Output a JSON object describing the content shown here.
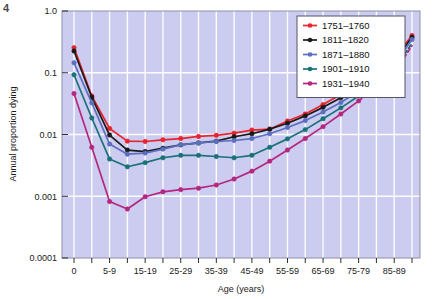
{
  "figure": {
    "number_marker": "4"
  },
  "chart_data": {
    "type": "line",
    "title": "",
    "xlabel": "Age (years)",
    "ylabel": "Annual proportion dying",
    "yscale": "log",
    "ylim": [
      0.0001,
      1.0
    ],
    "ytick_labels": [
      "1.0",
      "0.1",
      "0.01",
      "0.001",
      "0.0001"
    ],
    "ytick_values": [
      1.0,
      0.1,
      0.01,
      0.001,
      0.0001
    ],
    "grid": true,
    "grid_color": "#ffffff",
    "plot_background": "#ccccf0",
    "legend_position": "top-right",
    "categories": [
      "0",
      "1-4",
      "5-9",
      "10-14",
      "15-19",
      "20-24",
      "25-29",
      "30-34",
      "35-39",
      "40-44",
      "45-49",
      "50-54",
      "55-59",
      "60-64",
      "65-69",
      "70-74",
      "75-79",
      "80-84",
      "85-89",
      "90-94"
    ],
    "xtick_labels": [
      "0",
      "5-9",
      "15-19",
      "25-29",
      "35-39",
      "45-49",
      "55-59",
      "65-69",
      "75-79",
      "85-89"
    ],
    "xtick_category_index": [
      0,
      2,
      4,
      6,
      8,
      10,
      12,
      14,
      16,
      18
    ],
    "series": [
      {
        "name": "1751-1760",
        "color": "#e8242c",
        "dash_from_index": null,
        "values": [
          0.255,
          0.042,
          0.0125,
          0.0078,
          0.0077,
          0.0082,
          0.0086,
          0.0093,
          0.0097,
          0.0105,
          0.0118,
          0.0122,
          0.0165,
          0.0215,
          0.0305,
          0.0445,
          0.068,
          0.105,
          0.175,
          0.4
        ]
      },
      {
        "name": "1811-1820",
        "color": "#1a1a1a",
        "dash_from_index": null,
        "values": [
          0.225,
          0.04,
          0.0098,
          0.0056,
          0.0053,
          0.006,
          0.0068,
          0.0073,
          0.0078,
          0.0092,
          0.0103,
          0.0122,
          0.0152,
          0.02,
          0.0275,
          0.0395,
          0.058,
          0.092,
          0.155,
          0.375
        ]
      },
      {
        "name": "1871-1880",
        "color": "#5b6fc0",
        "dash_from_index": null,
        "values": [
          0.145,
          0.0325,
          0.007,
          0.0048,
          0.005,
          0.0058,
          0.0068,
          0.0073,
          0.0077,
          0.008,
          0.0086,
          0.0103,
          0.013,
          0.0168,
          0.0232,
          0.033,
          0.05,
          0.079,
          0.135,
          0.345
        ]
      },
      {
        "name": "1901-1910",
        "color": "#19717a",
        "dash_from_index": 16,
        "values": [
          0.093,
          0.0185,
          0.004,
          0.003,
          0.0035,
          0.0042,
          0.0046,
          0.0046,
          0.0044,
          0.0042,
          0.0046,
          0.0062,
          0.0085,
          0.012,
          0.018,
          0.027,
          0.042,
          0.068,
          0.115,
          0.3
        ]
      },
      {
        "name": "1931-1940",
        "color": "#b3277f",
        "dash_from_index": 16,
        "values": [
          0.046,
          0.0062,
          0.00082,
          0.00062,
          0.00098,
          0.00118,
          0.00128,
          0.00135,
          0.00152,
          0.0019,
          0.00255,
          0.0037,
          0.0056,
          0.0086,
          0.0134,
          0.0215,
          0.035,
          0.058,
          0.1,
          0.275
        ]
      }
    ]
  }
}
